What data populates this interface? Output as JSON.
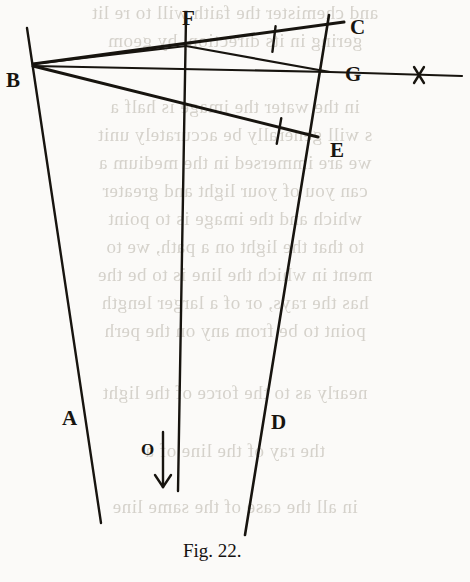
{
  "figure": {
    "caption": "Fig. 22.",
    "ink_color": "#17140f",
    "paper_color": "#fbfaf8",
    "bleed_color": "#c9c5bd",
    "vertex_labels": [
      {
        "id": "B",
        "text": "B",
        "x": 6,
        "y": 70
      },
      {
        "id": "F",
        "text": "F",
        "x": 182,
        "y": 8
      },
      {
        "id": "C",
        "text": "C",
        "x": 350,
        "y": 17
      },
      {
        "id": "G",
        "text": "G",
        "x": 345,
        "y": 64
      },
      {
        "id": "E",
        "text": "E",
        "x": 330,
        "y": 140
      },
      {
        "id": "A",
        "text": "A",
        "x": 62,
        "y": 408
      },
      {
        "id": "D",
        "text": "D",
        "x": 271,
        "y": 412
      },
      {
        "id": "O",
        "text": "O",
        "x": 141,
        "y": 441
      }
    ],
    "caption_position": {
      "x": 183,
      "y": 541
    },
    "lines": [
      {
        "name": "line-A-left-vertical",
        "x1": 27,
        "y1": 28,
        "x2": 101,
        "y2": 523,
        "width": 2.4
      },
      {
        "name": "line-center-vertical",
        "x1": 186,
        "y1": 18,
        "x2": 178,
        "y2": 491,
        "width": 2.4
      },
      {
        "name": "line-D-right-vertical",
        "x1": 329,
        "y1": 15,
        "x2": 245,
        "y2": 535,
        "width": 2.6
      },
      {
        "name": "line-B-to-C",
        "x1": 33,
        "y1": 64,
        "x2": 344,
        "y2": 22,
        "width": 3.0
      },
      {
        "name": "line-B-to-F-G",
        "x1": 33,
        "y1": 64,
        "x2": 186,
        "y2": 46,
        "width": 2.2
      },
      {
        "name": "line-F-to-G",
        "x1": 186,
        "y1": 46,
        "x2": 330,
        "y2": 72,
        "width": 2.2
      },
      {
        "name": "line-B-horizontal-to-G",
        "x1": 33,
        "y1": 66,
        "x2": 330,
        "y2": 72,
        "width": 2.2
      },
      {
        "name": "line-G-extension-right",
        "x1": 330,
        "y1": 72,
        "x2": 462,
        "y2": 76,
        "width": 2.2
      },
      {
        "name": "line-B-to-E",
        "x1": 33,
        "y1": 66,
        "x2": 318,
        "y2": 137,
        "width": 3.0
      }
    ],
    "tick_marks": [
      {
        "name": "tick-on-BC",
        "cx": 274,
        "cy": 39,
        "angle": 97,
        "length": 26,
        "width": 2.4
      },
      {
        "name": "tick-on-BE",
        "cx": 279,
        "cy": 131,
        "angle": 100,
        "length": 26,
        "width": 2.4
      }
    ],
    "cross_mark": {
      "name": "cross-mark-right",
      "cx": 419,
      "cy": 75,
      "size": 16,
      "width": 2.4
    },
    "arrow": {
      "name": "down-arrow-O",
      "x": 163,
      "y1": 432,
      "y2": 487,
      "width": 2.4,
      "head": 8
    }
  },
  "bleed_text": {
    "lines": [
      {
        "text": "and chemister the faith will to re lit",
        "y": 2,
        "size": 19
      },
      {
        "text": "gering in its direction, by geom",
        "y": 30,
        "size": 19
      },
      {
        "text": "in the water the image is half a",
        "y": 96,
        "size": 19
      },
      {
        "text": "s will generally be accurately unit",
        "y": 124,
        "size": 19
      },
      {
        "text": "we are immersed in the medium a",
        "y": 152,
        "size": 19
      },
      {
        "text": "can you of your light and greater",
        "y": 180,
        "size": 19
      },
      {
        "text": "which and the image is to point",
        "y": 208,
        "size": 19
      },
      {
        "text": "to that the light on a path, we to",
        "y": 236,
        "size": 19
      },
      {
        "text": "ment in which the line is to be the",
        "y": 264,
        "size": 19
      },
      {
        "text": "has the rays, or of a larger length",
        "y": 292,
        "size": 19
      },
      {
        "text": "point to be from any on the perh",
        "y": 320,
        "size": 19
      },
      {
        "text": "nearly as to the force of the light",
        "y": 382,
        "size": 19
      },
      {
        "text": "the ray of the line of a",
        "y": 440,
        "size": 19
      },
      {
        "text": "in all the case of the same line",
        "y": 496,
        "size": 19
      }
    ]
  }
}
